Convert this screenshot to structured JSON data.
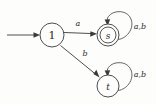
{
  "figure": {
    "background_color": "#fdfdfc",
    "ink_color": "#3a3a3a",
    "width": 156,
    "height": 104
  },
  "states": [
    {
      "id": "1",
      "label": "1",
      "accepting": false,
      "initial": true,
      "cx": 52,
      "cy": 35,
      "r": 12,
      "font_size": 11
    },
    {
      "id": "s",
      "label": "s",
      "accepting": true,
      "initial": false,
      "cx": 108,
      "cy": 35,
      "r": 11,
      "inner_r": 8,
      "font_size": 9
    },
    {
      "id": "t",
      "label": "t",
      "accepting": false,
      "initial": false,
      "cx": 108,
      "cy": 86,
      "r": 11,
      "font_size": 9
    }
  ],
  "transitions": [
    {
      "from": "start",
      "to": "1",
      "label": "",
      "kind": "initial-arrow"
    },
    {
      "from": "1",
      "to": "s",
      "label": "a",
      "kind": "straight",
      "label_x": 78,
      "label_y": 23
    },
    {
      "from": "1",
      "to": "t",
      "label": "b",
      "kind": "diagonal",
      "label_x": 85,
      "label_y": 53
    },
    {
      "from": "s",
      "to": "s",
      "label": "a,b",
      "kind": "self-loop",
      "label_x": 140,
      "label_y": 26
    },
    {
      "from": "t",
      "to": "t",
      "label": "a,b",
      "kind": "self-loop",
      "label_x": 140,
      "label_y": 74
    }
  ],
  "alphabet": [
    "a",
    "b"
  ],
  "icons": {
    "start_arrow": "arrow-right-icon",
    "self_loop": "loop-arrow-icon"
  }
}
